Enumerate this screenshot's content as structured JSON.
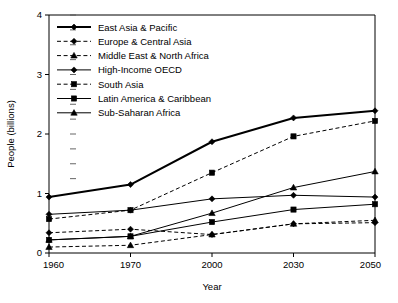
{
  "chart_data": {
    "type": "line",
    "title": "",
    "subtitle": "",
    "xlabel": "Year",
    "ylabel": "People (billions)",
    "categories": [
      "1960",
      "1970",
      "2000",
      "2030",
      "2050"
    ],
    "x": [
      1960,
      1970,
      2000,
      2030,
      2050
    ],
    "xtick_labels": [
      "1960",
      "1970",
      "2000",
      "2030",
      "2050"
    ],
    "ytick_labels": [
      "0",
      "1",
      "2",
      "3",
      "4"
    ],
    "yticks": [
      0,
      1,
      2,
      3,
      4
    ],
    "ylim": [
      0,
      4
    ],
    "grid": false,
    "legend_position": "upper-left-inside",
    "axis_spacing": "categorical",
    "series": [
      {
        "name": "East Asia & Pacific",
        "values": [
          0.94,
          1.15,
          1.87,
          2.27,
          2.39
        ],
        "marker": "diamond",
        "linestyle": "solid",
        "linewidth": 2.0,
        "color": "#000000"
      },
      {
        "name": "Europe & Central Asia",
        "values": [
          0.34,
          0.4,
          0.31,
          0.49,
          0.51
        ],
        "marker": "diamond",
        "linestyle": "dashed",
        "linewidth": 1.0,
        "color": "#000000"
      },
      {
        "name": "Middle East & North Africa",
        "values": [
          0.1,
          0.13,
          0.31,
          0.49,
          0.55
        ],
        "marker": "triangle",
        "linestyle": "dashed",
        "linewidth": 1.0,
        "color": "#000000"
      },
      {
        "name": "High-Income OECD",
        "values": [
          0.65,
          0.72,
          0.91,
          0.97,
          0.94
        ],
        "marker": "diamond",
        "linestyle": "solid",
        "linewidth": 1.0,
        "color": "#000000"
      },
      {
        "name": "South Asia",
        "values": [
          0.57,
          0.72,
          1.35,
          1.96,
          2.22
        ],
        "marker": "square",
        "linestyle": "dashed",
        "linewidth": 1.0,
        "color": "#000000"
      },
      {
        "name": "Latin America & Caribbean",
        "values": [
          0.22,
          0.28,
          0.52,
          0.73,
          0.82
        ],
        "marker": "square",
        "linestyle": "solid",
        "linewidth": 1.0,
        "color": "#000000"
      },
      {
        "name": "Sub-Saharan Africa",
        "values": [
          0.22,
          0.28,
          0.67,
          1.1,
          1.37
        ],
        "marker": "triangle",
        "linestyle": "solid",
        "linewidth": 1.0,
        "color": "#000000"
      }
    ]
  },
  "legend": {
    "items": [
      {
        "label": "East Asia & Pacific"
      },
      {
        "label": "Europe & Central Asia"
      },
      {
        "label": "Middle East & North Africa"
      },
      {
        "label": "High-Income OECD"
      },
      {
        "label": "South Asia"
      },
      {
        "label": "Latin America & Caribbean"
      },
      {
        "label": "Sub-Saharan Africa"
      }
    ]
  },
  "axes": {
    "x_title": "Year",
    "y_title": "People (billions)"
  }
}
